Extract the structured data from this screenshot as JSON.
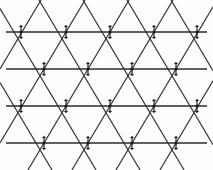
{
  "figure": {
    "width": 213,
    "height": 170,
    "background_color": "#fdfdfc"
  },
  "style": {
    "horizontal_line_color": "#2b2b2b",
    "diagonal_line_color": "#3a3a3a",
    "vertex_color": "#1c1c1c",
    "horizontal_line_width": 1.7,
    "diagonal_line_width": 1.25,
    "vertex_tick_width": 1.15
  },
  "chart_data": {
    "type": "diagram",
    "lattice_kind": "triangular",
    "row_spacing": 37,
    "column_spacing": 44,
    "horizontal_line_count": 4,
    "vertex_count": 18,
    "horizontal_lines": [
      {
        "id": "h1",
        "y": 32,
        "x_start": 6,
        "x_end": 207
      },
      {
        "id": "h2",
        "y": 69,
        "x_start": 6,
        "x_end": 207
      },
      {
        "id": "h3",
        "y": 106,
        "x_start": 6,
        "x_end": 207
      },
      {
        "id": "h4",
        "y": 143,
        "x_start": 6,
        "x_end": 207
      }
    ],
    "vertex_rows": [
      {
        "row": 1,
        "y": 32,
        "x_positions": [
          21,
          66,
          110,
          154,
          197
        ]
      },
      {
        "row": 2,
        "y": 69,
        "x_positions": [
          44,
          88,
          132,
          176
        ]
      },
      {
        "row": 3,
        "y": 106,
        "x_positions": [
          21,
          66,
          110,
          154,
          197
        ]
      },
      {
        "row": 4,
        "y": 143,
        "x_positions": [
          44,
          88,
          132,
          176
        ]
      }
    ],
    "diagonal_slope_up_offsets": [
      -110,
      -66,
      -22,
      22,
      66,
      110,
      154,
      198,
      242
    ],
    "diagonal_slope_down_offsets": [
      -30,
      14,
      58,
      102,
      146,
      190,
      234,
      278,
      322
    ],
    "vertex_tick_length": 7,
    "vertex_core_radius": 1.6,
    "clip_top": 0,
    "clip_bottom": 170,
    "clip_left": 0,
    "clip_right": 213
  }
}
